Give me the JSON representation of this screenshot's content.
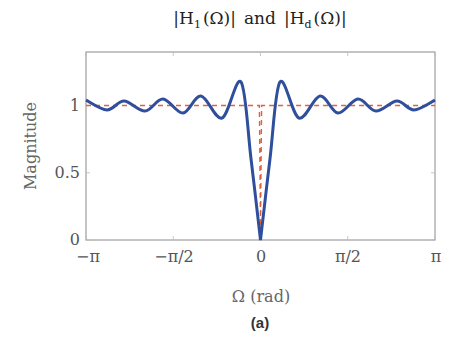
{
  "figure": {
    "title_parts": {
      "left": "|H",
      "left_sub": "1",
      "left_arg": "(Ω)|",
      "mid": "and",
      "right": "|H",
      "right_sub": "d",
      "right_arg": "(Ω)|"
    },
    "ylabel": "Magnitude",
    "xlabel": "Ω (rad)",
    "subfigure_label": "(a)",
    "xticks": [
      "−π",
      "−π/2",
      "0",
      "π/2",
      "π"
    ],
    "yticks": [
      "0",
      "0.5",
      "1"
    ],
    "colors": {
      "actual": "#2f4f9c",
      "desired": "#e0603c",
      "axis": "#888888"
    }
  },
  "chart_data": {
    "type": "line",
    "xlabel": "Ω (rad)",
    "ylabel": "Magnitude",
    "xlim": [
      -3.1416,
      3.1416
    ],
    "ylim": [
      0,
      1.4
    ],
    "xticks": [
      -3.1416,
      -1.5708,
      0,
      1.5708,
      3.1416
    ],
    "xtick_labels": [
      "−π",
      "−π/2",
      "0",
      "π/2",
      "π"
    ],
    "yticks": [
      0,
      0.5,
      1
    ],
    "grid": false,
    "legend": null,
    "series": [
      {
        "name": "|H_1(Ω)|",
        "style": "solid",
        "color": "#2f4f9c",
        "x": [
          -3.1416,
          -2.763,
          -2.457,
          -2.079,
          -1.755,
          -1.395,
          -1.071,
          -0.693,
          -0.351,
          -0.17,
          0,
          0.17,
          0.351,
          0.693,
          1.071,
          1.395,
          1.755,
          2.079,
          2.457,
          2.763,
          3.1416
        ],
        "y": [
          1.04,
          0.967,
          1.033,
          0.959,
          1.048,
          0.944,
          1.07,
          0.907,
          1.175,
          0.6,
          0.0,
          0.6,
          1.175,
          0.907,
          1.07,
          0.944,
          1.048,
          0.959,
          1.033,
          0.967,
          1.04
        ]
      },
      {
        "name": "|H_d(Ω)|",
        "style": "dashed",
        "color": "#e0603c",
        "x": [
          -3.1416,
          -0.02,
          0,
          0.02,
          3.1416
        ],
        "y": [
          1,
          1,
          0.1,
          1,
          1
        ]
      }
    ]
  }
}
